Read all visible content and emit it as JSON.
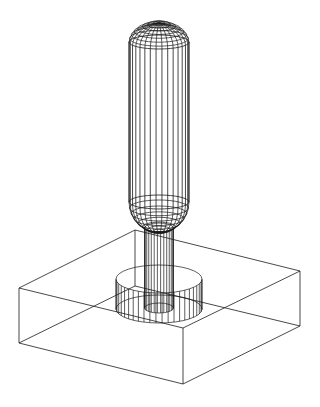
{
  "figure": {
    "title": "",
    "background": "#ffffff",
    "stroke_color": "#1a1a1a",
    "canvas": {
      "width": 320,
      "height": 407
    }
  },
  "parts": {
    "handle": {
      "cx": 159,
      "rx": 30,
      "ry": 7,
      "body_top_y": 42,
      "body_bottom_y": 202,
      "cap_top_y": 23,
      "cap_bottom_y": 232,
      "meridians": 16,
      "cap_rings": 8
    },
    "shaft": {
      "cx": 159,
      "rx": 14.5,
      "ry": 5,
      "top_y": 228,
      "bottom_y": 308,
      "meridians": 14
    },
    "collar": {
      "cx": 159,
      "rx": 43,
      "ry": 14,
      "top_y": 279,
      "bottom_y": 309,
      "meridians": 22
    },
    "base_block": {
      "top": [
        [
          135,
          230
        ],
        [
          300,
          271
        ],
        [
          183,
          328
        ],
        [
          19,
          288
        ]
      ],
      "bottom": [
        [
          135,
          286
        ],
        [
          300,
          326
        ],
        [
          183,
          384
        ],
        [
          19,
          343
        ]
      ]
    }
  }
}
